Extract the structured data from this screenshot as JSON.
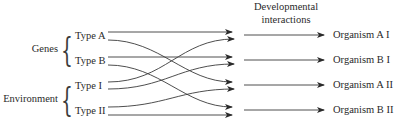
{
  "header": {
    "line1": "Developmental",
    "line2": "interactions"
  },
  "groups": [
    {
      "label": "Genes",
      "types": [
        "Type A",
        "Type B"
      ]
    },
    {
      "label": "Environment",
      "types": [
        "Type I",
        "Type II"
      ]
    }
  ],
  "outputs": [
    "Organism A I",
    "Organism B I",
    "Organism A II",
    "Organism B II"
  ],
  "connections": [
    {
      "from": "Type A",
      "to": "Organism A I"
    },
    {
      "from": "Type A",
      "to": "Organism A II"
    },
    {
      "from": "Type B",
      "to": "Organism B I"
    },
    {
      "from": "Type B",
      "to": "Organism B II"
    },
    {
      "from": "Type I",
      "to": "Organism A I"
    },
    {
      "from": "Type I",
      "to": "Organism B I"
    },
    {
      "from": "Type II",
      "to": "Organism A II"
    },
    {
      "from": "Type II",
      "to": "Organism B II"
    }
  ],
  "colors": {
    "line": "#3a3a3a",
    "text": "#2a2a2a"
  }
}
